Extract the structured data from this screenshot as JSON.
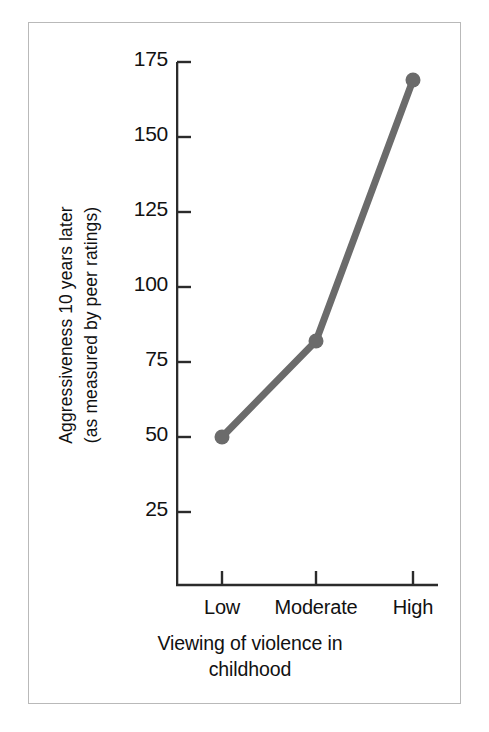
{
  "chart_data": {
    "type": "line",
    "title": "",
    "categories": [
      "Low",
      "Moderate",
      "High"
    ],
    "values": [
      50,
      82,
      169
    ],
    "series": [
      {
        "name": "Aggressiveness",
        "values": [
          50,
          82,
          169
        ]
      }
    ],
    "xlabel": "Viewing of violence in childhood",
    "xlabel_line1": "Viewing of violence in",
    "xlabel_line2": "childhood",
    "ylabel": "Aggressiveness 10 years later (as measured by peer ratings)",
    "ylabel_line1": "Aggressiveness  10  years later",
    "ylabel_line2": "(as measured by peer ratings)",
    "yticks": [
      25,
      50,
      75,
      100,
      125,
      150,
      175
    ],
    "ytick_labels": [
      "25",
      "50",
      "75",
      "100",
      "125",
      "150",
      "175"
    ],
    "ylim": [
      0,
      175
    ],
    "xtick_labels": [
      "Low",
      "Moderate",
      "High"
    ],
    "grid": false,
    "legend": "none",
    "line_color": "#6b6b6b",
    "marker_color": "#6b6b6b",
    "axis_color": "#2b2b2b",
    "frame_color": "#b9b9b9",
    "background_color": "#ffffff",
    "text_color": "#111111"
  }
}
